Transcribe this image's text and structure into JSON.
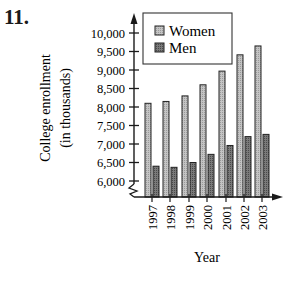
{
  "problem_number": "11.",
  "colors": {
    "women": "#b8b8b8",
    "men": "#6e6e6e",
    "axis": "#1a1a1a"
  },
  "chart_data": {
    "type": "bar",
    "title": "",
    "xlabel": "Year",
    "ylabel": "College enrollment (in thousands)",
    "ylabel_lines": [
      "College enrollment",
      "(in thousands)"
    ],
    "categories": [
      "1997",
      "1998",
      "1999",
      "2000",
      "2001",
      "2002",
      "2003"
    ],
    "series": [
      {
        "name": "Women",
        "values": [
          8100,
          8150,
          8300,
          8600,
          8970,
          9410,
          9650
        ]
      },
      {
        "name": "Men",
        "values": [
          6400,
          6370,
          6500,
          6720,
          6960,
          7200,
          7260
        ]
      }
    ],
    "ylim": [
      6000,
      10000
    ],
    "y_axis_break": true,
    "yticks": [
      6000,
      6500,
      7000,
      7500,
      8000,
      8500,
      9000,
      9500,
      10000
    ],
    "ytick_labels": [
      "6,000",
      "6,500",
      "7,000",
      "7,500",
      "8,000",
      "8,500",
      "9,000",
      "9,500",
      "10,000"
    ],
    "legend": {
      "position": "upper-left-inside",
      "entries": [
        "Women",
        "Men"
      ]
    },
    "grid": false
  }
}
